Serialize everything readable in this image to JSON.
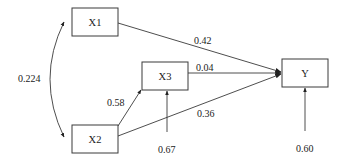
{
  "diagram": {
    "type": "path-diagram",
    "nodes": [
      {
        "id": "X1",
        "label": "X1"
      },
      {
        "id": "X2",
        "label": "X2"
      },
      {
        "id": "X3",
        "label": "X3"
      },
      {
        "id": "Y",
        "label": "Y"
      }
    ],
    "edges": [
      {
        "from": "X1",
        "to": "Y",
        "label": "0.42",
        "kind": "direct"
      },
      {
        "from": "X3",
        "to": "Y",
        "label": "0.04",
        "kind": "direct"
      },
      {
        "from": "X2",
        "to": "Y",
        "label": "0.36",
        "kind": "direct"
      },
      {
        "from": "X2",
        "to": "X3",
        "label": "0.58",
        "kind": "direct"
      },
      {
        "from": "X1",
        "to": "X2",
        "label": "0.224",
        "kind": "correlation"
      },
      {
        "from": "error-X3",
        "to": "X3",
        "label": "0.67",
        "kind": "residual"
      },
      {
        "from": "error-Y",
        "to": "Y",
        "label": "0.60",
        "kind": "residual"
      }
    ],
    "colors": {
      "stroke": "#3a3a3a",
      "text": "#222222",
      "background": "#ffffff"
    }
  }
}
